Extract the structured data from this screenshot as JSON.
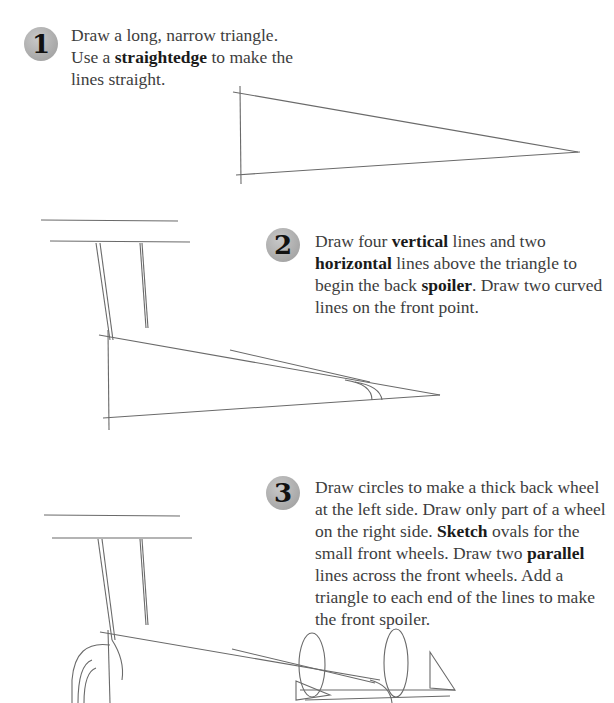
{
  "steps": [
    {
      "number": "1",
      "text_parts": [
        "Draw a long, narrow triangle. Use a ",
        "straightedge",
        " to make the lines straight."
      ]
    },
    {
      "number": "2",
      "text_parts": [
        "Draw four ",
        "vertical",
        " lines and two ",
        "horizontal",
        " lines above the triangle to begin the back ",
        "spoiler",
        ". Draw two curved lines on the front point."
      ]
    },
    {
      "number": "3",
      "text_parts": [
        "Draw circles to make a thick back wheel at the left side. Draw only part of a wheel on the right side. ",
        "Sketch",
        " ovals for the small front wheels. Draw two ",
        "parallel",
        " lines across the front wheels. Add a triangle to each end of the lines to make the front spoiler."
      ]
    }
  ],
  "colors": {
    "badge": "#a8a8a8",
    "text": "#3d3d3d",
    "sketch": "#6a6a6a"
  }
}
